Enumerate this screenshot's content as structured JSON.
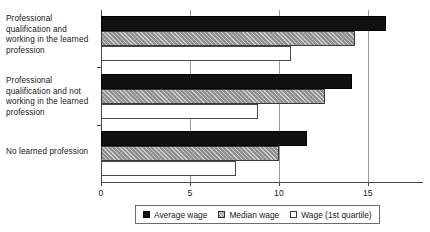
{
  "chart_data": {
    "type": "bar",
    "orientation": "horizontal",
    "title": "",
    "subtitle": "",
    "xlabel": "",
    "ylabel": "",
    "xlim": [
      0,
      18.1
    ],
    "xticks": [
      0,
      5,
      10,
      15
    ],
    "xtick_labels": [
      "0",
      "5",
      "10",
      "15"
    ],
    "grid": "vertical-gridlines-at-xticks",
    "legend_position": "bottom-center",
    "categories": [
      "Professional qualification and working in the learned profession",
      "Professional qualification and not working in the learned profession",
      "No learned profession"
    ],
    "series": [
      {
        "name": "Average wage",
        "color": "#111111",
        "pattern": "solid",
        "values": [
          16.0,
          14.1,
          11.6
        ]
      },
      {
        "name": "Median wage",
        "color": "#8f8f8f",
        "pattern": "diagonal-hatch",
        "values": [
          14.3,
          12.6,
          10.0
        ]
      },
      {
        "name": "Wage (1st quartile)",
        "color": "#ffffff",
        "pattern": "empty",
        "values": [
          10.7,
          8.8,
          7.6
        ]
      }
    ]
  },
  "axis": {
    "ticks": [
      {
        "label": "0",
        "value": 0
      },
      {
        "label": "5",
        "value": 5
      },
      {
        "label": "10",
        "value": 10
      },
      {
        "label": "15",
        "value": 15
      }
    ]
  },
  "categories": [
    {
      "label": "Professional qualification and working in the learned profession"
    },
    {
      "label": "Professional qualification and not working in the learned profession"
    },
    {
      "label": "No learned profession"
    }
  ],
  "legend": {
    "items": [
      {
        "label": "Average wage"
      },
      {
        "label": "Median wage"
      },
      {
        "label": "Wage (1st quartile)"
      }
    ]
  }
}
